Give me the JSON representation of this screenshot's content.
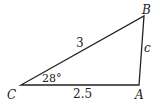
{
  "diagram": {
    "type": "triangle",
    "vertices": {
      "C": {
        "label": "C",
        "x": 21,
        "y": 85
      },
      "A": {
        "label": "A",
        "x": 139,
        "y": 85
      },
      "B": {
        "label": "B",
        "x": 144,
        "y": 16
      }
    },
    "sides": {
      "CB": {
        "label": "3"
      },
      "CA": {
        "label": "2.5"
      },
      "AB": {
        "label": "c"
      }
    },
    "angle_C": {
      "label": "28°"
    },
    "stroke_color": "#222222"
  }
}
